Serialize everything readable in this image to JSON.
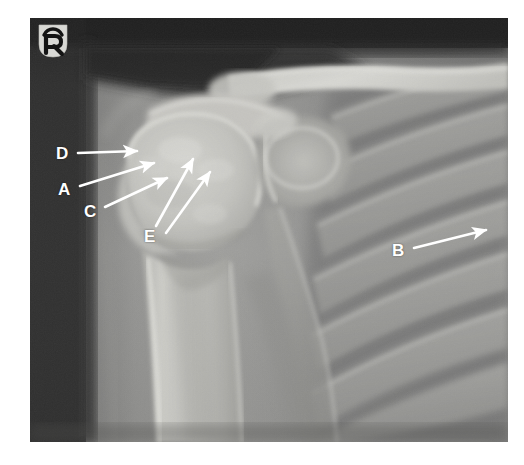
{
  "image": {
    "modality": "X-ray radiograph",
    "body_part": "right shoulder",
    "view": "anteroposterior",
    "background_color": "#ffffff",
    "plate": {
      "x": 30,
      "y": 18,
      "width": 478,
      "height": 424
    }
  },
  "side_marker": {
    "text": "R",
    "name": "right-side-radiographic-marker",
    "x": 38,
    "y": 24
  },
  "annotations": [
    {
      "id": "D",
      "label": "D",
      "label_x": 56,
      "label_y": 145,
      "arrows": [
        {
          "x1": 78,
          "y1": 153,
          "x2": 137,
          "y2": 151
        }
      ]
    },
    {
      "id": "A",
      "label": "A",
      "label_x": 58,
      "label_y": 181,
      "arrows": [
        {
          "x1": 80,
          "y1": 186,
          "x2": 154,
          "y2": 163
        }
      ]
    },
    {
      "id": "C",
      "label": "C",
      "label_x": 84,
      "label_y": 203,
      "arrows": [
        {
          "x1": 105,
          "y1": 207,
          "x2": 167,
          "y2": 178
        }
      ]
    },
    {
      "id": "B",
      "label": "B",
      "label_x": 392,
      "label_y": 242,
      "arrows": [
        {
          "x1": 414,
          "y1": 248,
          "x2": 486,
          "y2": 230
        }
      ]
    },
    {
      "id": "E",
      "label": "E",
      "label_x": 144,
      "label_y": 228,
      "arrows": [
        {
          "x1": 156,
          "y1": 226,
          "x2": 193,
          "y2": 159
        },
        {
          "x1": 166,
          "y1": 233,
          "x2": 210,
          "y2": 172
        }
      ]
    }
  ],
  "colors": {
    "annotation": "#ffffff",
    "collimation_dark": "#2b2b2b",
    "bone_bright": "#e8e8e4",
    "soft_tissue": "#9a9a98",
    "lung_field": "#6d6d6c",
    "page_background": "#ffffff"
  }
}
